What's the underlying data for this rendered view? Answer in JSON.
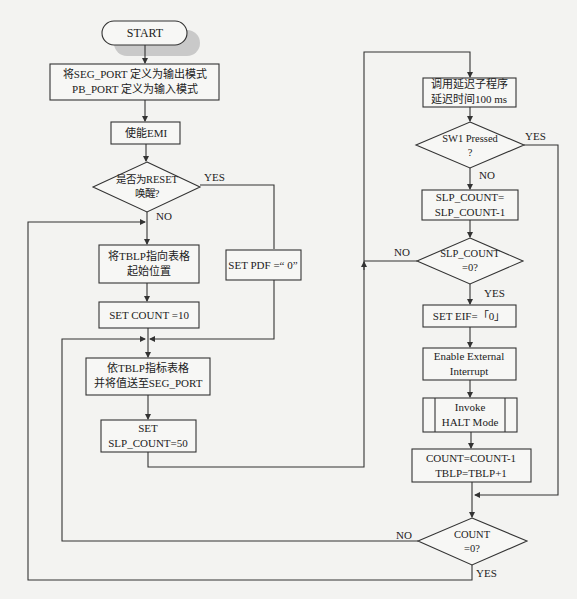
{
  "diagram": {
    "type": "flowchart",
    "nodes": {
      "start": {
        "label": "START",
        "shape": "terminator"
      },
      "init_ports": {
        "line1": "将SEG_PORT  定义为输出模式",
        "line2": "PB_PORT 定义为输入模式",
        "shape": "process"
      },
      "enable_emi": {
        "label": "使能EMI",
        "shape": "process"
      },
      "reset_check": {
        "line1": "是否为RESET",
        "line2": "唤醒?",
        "shape": "decision"
      },
      "set_tblp": {
        "line1": "将TBLP指向表格",
        "line2": "起始位置",
        "shape": "process"
      },
      "set_count": {
        "label": "SET COUNT =10",
        "shape": "process"
      },
      "set_pdf": {
        "label": "SET PDF =“  0”",
        "shape": "process"
      },
      "send_seg": {
        "line1": "依TBLP指标表格",
        "line2": "并将值送至SEG_PORT",
        "shape": "process"
      },
      "set_slp": {
        "line1": "SET",
        "line2": "SLP_COUNT=50",
        "shape": "process"
      },
      "delay": {
        "line1": "调用延迟子程序",
        "line2": "延迟时间100 ms",
        "shape": "process"
      },
      "sw1_check": {
        "line1": "SW1 Pressed",
        "line2": "?",
        "shape": "decision"
      },
      "dec_slp": {
        "line1": "SLP_COUNT=",
        "line2": "SLP_COUNT-1",
        "shape": "process"
      },
      "slp_zero": {
        "line1": "SLP_COUNT",
        "line2": "=0?",
        "shape": "decision"
      },
      "set_eif": {
        "label": "SET EIF=「0」",
        "shape": "process"
      },
      "enable_ext_int": {
        "line1": "Enable External",
        "line2": "Interrupt",
        "shape": "process"
      },
      "halt": {
        "line1": "Invoke",
        "line2": "HALT Mode",
        "shape": "predefined-process"
      },
      "update_count": {
        "line1": "COUNT=COUNT-1",
        "line2": "TBLP=TBLP+1",
        "shape": "process"
      },
      "count_zero": {
        "line1": "COUNT",
        "line2": "=0?",
        "shape": "decision"
      }
    },
    "edge_labels": {
      "reset_yes": "YES",
      "reset_no": "NO",
      "sw1_yes": "YES",
      "sw1_no": "NO",
      "slp_no": "NO",
      "slp_yes": "YES",
      "count_no": "NO",
      "count_yes": "YES"
    },
    "colors": {
      "line": "#333333",
      "background": "#f3f3f1",
      "shadow": "#c8c8c8"
    }
  }
}
